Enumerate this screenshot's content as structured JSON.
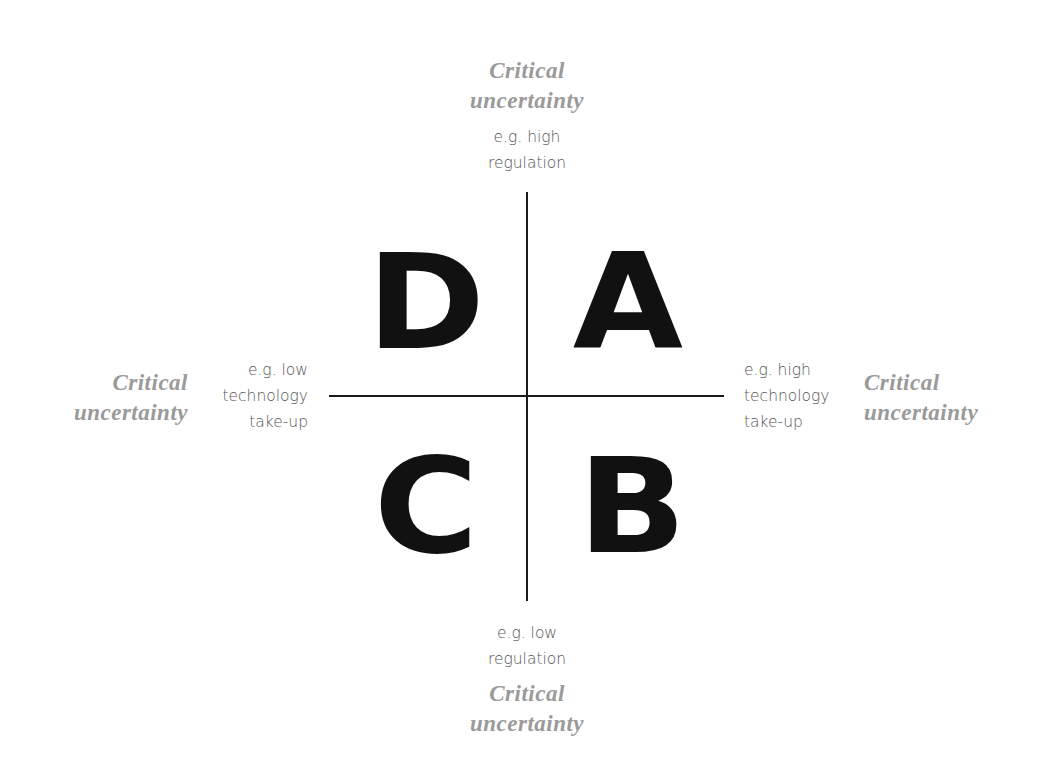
{
  "diagram": {
    "type": "scenario-matrix-2x2",
    "quadrants": {
      "top_left": "D",
      "top_right": "A",
      "bottom_left": "C",
      "bottom_right": "B"
    },
    "axes": {
      "top": {
        "title_line1": "Critical",
        "title_line2": "uncertainty",
        "example_line1": "e.g. high",
        "example_line2": "regulation"
      },
      "bottom": {
        "example_line1": "e.g. low",
        "example_line2": "regulation",
        "title_line1": "Critical",
        "title_line2": "uncertainty"
      },
      "left": {
        "title_line1": "Critical",
        "title_line2": "uncertainty",
        "example_line1": "e.g. low",
        "example_line2": "technology",
        "example_line3": "take-up"
      },
      "right": {
        "example_line1": "e.g. high",
        "example_line2": "technology",
        "example_line3": "take-up",
        "title_line1": "Critical",
        "title_line2": "uncertainty"
      }
    },
    "colors": {
      "axis_line": "#1a1a1a",
      "letters": "#111111",
      "critical_label": "#9a9a9a",
      "example_text": "#555555",
      "background": "#ffffff"
    }
  }
}
